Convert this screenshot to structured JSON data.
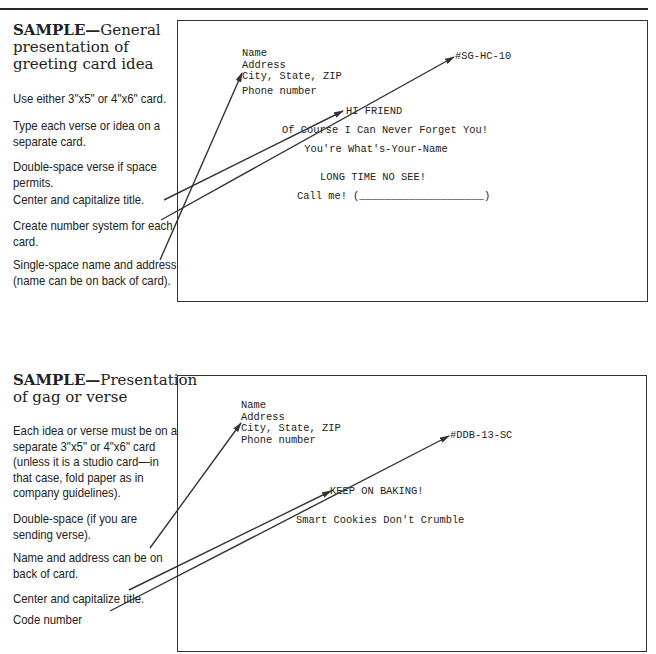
{
  "sample1": {
    "heading_lead": "SAMPLE—",
    "heading_rest_line1": "General",
    "heading_line2": "presentation of",
    "heading_line3": "greeting card idea",
    "notes": [
      {
        "lines": [
          "Use either 3\"x5\" or 4\"x6\" card."
        ]
      },
      {
        "lines": [
          "Type each verse or idea on a",
          "separate card."
        ]
      },
      {
        "lines": [
          "Double-space verse if space",
          "permits."
        ]
      },
      {
        "lines": [
          "Center and capitalize title."
        ]
      },
      {
        "lines": [
          "Create number system for each",
          "card."
        ]
      },
      {
        "lines": [
          "Single-space name and address",
          "(name can be on back of card)."
        ]
      }
    ],
    "card": {
      "address_lines": [
        "Name",
        "Address",
        "City, State, ZIP"
      ],
      "phone": "Phone number",
      "code": "#SG-HC-10",
      "title": "HI FRIEND",
      "verse_line1": "Of Course I Can Never Forget You!",
      "verse_line2": "You're What's-Your-Name",
      "punchline": "LONG TIME NO SEE!",
      "call_me": "Call me! (____________________)"
    }
  },
  "sample2": {
    "heading_lead": "SAMPLE—",
    "heading_rest_line1": "Presentation",
    "heading_line2": "of gag or verse",
    "notes": [
      {
        "lines": [
          "Each idea or verse must be on a",
          "separate 3\"x5\" or 4\"x6\" card",
          "(unless it is a studio card—in",
          "that case, fold paper as in",
          "company guidelines)."
        ]
      },
      {
        "lines": [
          "Double-space (if you are",
          "sending verse)."
        ]
      },
      {
        "lines": [
          "Name and address can be on",
          "back of card."
        ]
      },
      {
        "lines": [
          "Center and capitalize title."
        ]
      },
      {
        "lines": [
          "Code number"
        ]
      }
    ],
    "card": {
      "address_lines": [
        "Name",
        "Address",
        "City, State, ZIP",
        "Phone number"
      ],
      "code": "#DDB-13-SC",
      "title": "KEEP ON BAKING!",
      "verse": "Smart Cookies Don't Crumble"
    }
  },
  "colors": {
    "ink": "#222222",
    "line": "#333333",
    "paper": "#ffffff"
  }
}
